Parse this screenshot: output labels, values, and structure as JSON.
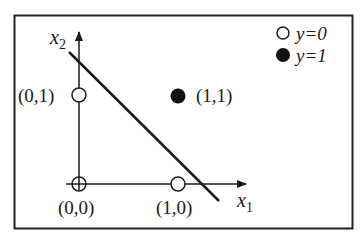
{
  "diagram": {
    "axes": {
      "x_label": "x",
      "x_sub": "1",
      "y_label": "x",
      "y_sub": "2"
    },
    "points": [
      {
        "label": "(0,0)",
        "class": 0
      },
      {
        "label": "(0,1)",
        "class": 0
      },
      {
        "label": "(1,0)",
        "class": 0
      },
      {
        "label": "(1,1)",
        "class": 1
      }
    ],
    "legend": [
      {
        "marker": "open-circle",
        "text": "y=0"
      },
      {
        "marker": "filled-circle",
        "text": "y=1"
      }
    ],
    "decision_boundary": "linear separator",
    "colors": {
      "ink": "#1a1a1a",
      "background": "#ffffff"
    }
  }
}
